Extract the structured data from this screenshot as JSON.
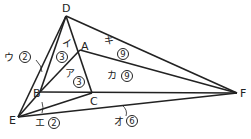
{
  "diagram": {
    "type": "geometry",
    "points": {
      "D": {
        "label": "D",
        "x": 66,
        "y": 16
      },
      "A": {
        "label": "A",
        "x": 80,
        "y": 50
      },
      "B": {
        "label": "B",
        "x": 40,
        "y": 92
      },
      "C": {
        "label": "C",
        "x": 92,
        "y": 93
      },
      "E": {
        "label": "E",
        "x": 18,
        "y": 117
      },
      "F": {
        "label": "F",
        "x": 237,
        "y": 93
      }
    },
    "segments": [
      [
        "D",
        "E"
      ],
      [
        "D",
        "B"
      ],
      [
        "D",
        "C"
      ],
      [
        "D",
        "F"
      ],
      [
        "A",
        "B"
      ],
      [
        "A",
        "F"
      ],
      [
        "B",
        "F"
      ],
      [
        "B",
        "E"
      ],
      [
        "E",
        "C"
      ],
      [
        "E",
        "F"
      ]
    ],
    "area_labels": [
      {
        "kana": "ア",
        "value": "3"
      },
      {
        "kana": "イ",
        "value": "3"
      },
      {
        "kana": "ウ",
        "value": "2"
      },
      {
        "kana": "エ",
        "value": "2"
      },
      {
        "kana": "オ",
        "value": "6"
      },
      {
        "kana": "カ",
        "value": "9"
      },
      {
        "kana": "キ",
        "value": "9"
      }
    ]
  }
}
